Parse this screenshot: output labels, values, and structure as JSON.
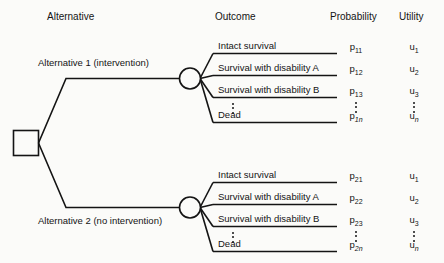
{
  "diagram": {
    "type": "decision-tree",
    "line_color": "#141414",
    "background_color": "#fbfbf9"
  },
  "headers": {
    "alternative": "Alternative",
    "outcome": "Outcome",
    "probability": "Probability",
    "utility": "Utility"
  },
  "nodes": {
    "decision_node": "decision-square",
    "chance_node_1": "chance-circle",
    "chance_node_2": "chance-circle"
  },
  "branches": [
    {
      "id": "alternative-1",
      "label": "Alternative 1 (intervention)",
      "label_position": "above",
      "outcomes": [
        {
          "outcome": "Intact survival",
          "probability_base": "p",
          "probability_sub": "11",
          "utility_base": "u",
          "utility_sub": "1"
        },
        {
          "outcome": "Survival with disability A",
          "probability_base": "p",
          "probability_sub": "12",
          "utility_base": "u",
          "utility_sub": "2"
        },
        {
          "outcome": "Survival with disability B",
          "probability_base": "p",
          "probability_sub": "13",
          "utility_base": "u",
          "utility_sub": "3"
        },
        {
          "outcome": "Dead",
          "probability_base": "p",
          "probability_sub": "1n",
          "probability_sub_italic": true,
          "utility_base": "u",
          "utility_sub": "n",
          "utility_sub_italic": true
        }
      ],
      "ellipsis": "⋮"
    },
    {
      "id": "alternative-2",
      "label": "Alternative 2 (no intervention)",
      "label_position": "below",
      "outcomes": [
        {
          "outcome": "Intact survival",
          "probability_base": "p",
          "probability_sub": "21",
          "utility_base": "u",
          "utility_sub": "1"
        },
        {
          "outcome": "Survival with disability A",
          "probability_base": "p",
          "probability_sub": "22",
          "utility_base": "u",
          "utility_sub": "2"
        },
        {
          "outcome": "Survival with disability B",
          "probability_base": "p",
          "probability_sub": "23",
          "utility_base": "u",
          "utility_sub": "3"
        },
        {
          "outcome": "Dead",
          "probability_base": "p",
          "probability_sub": "2n",
          "probability_sub_italic": true,
          "utility_base": "u",
          "utility_sub": "n",
          "utility_sub_italic": true
        }
      ],
      "ellipsis": "⋮"
    }
  ]
}
